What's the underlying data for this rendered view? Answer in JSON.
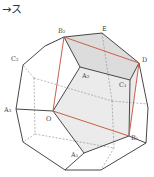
{
  "caption": "→ス",
  "colors": {
    "edge": "#333333",
    "hidden": "#888888",
    "red": "#c8604c",
    "shade": "#dcdcdc",
    "shade_light": "#ebebeb"
  },
  "points": {
    "B2": [
      64,
      37
    ],
    "E": [
      102,
      33
    ],
    "D": [
      139,
      63
    ],
    "C1": [
      130,
      80
    ],
    "A2": [
      80,
      67
    ],
    "O": [
      53,
      111
    ],
    "B1": [
      129,
      136
    ],
    "A1": [
      84,
      153
    ],
    "C2": [
      23,
      65
    ],
    "A3": [
      16,
      109
    ],
    "P_tl": [
      45,
      46
    ],
    "P_bl": [
      23,
      142
    ],
    "P_b1": [
      65,
      170
    ],
    "P_b2": [
      101,
      170
    ],
    "P_br": [
      146,
      143
    ],
    "P_r": [
      148,
      108
    ],
    "I_l1": [
      34,
      78
    ],
    "I_l2": [
      35,
      134
    ],
    "I_c": [
      112,
      101
    ],
    "I_b": [
      114,
      148
    ],
    "I_r": [
      148,
      104
    ]
  },
  "labels": [
    {
      "text": "B₂",
      "x": 58,
      "y": 33
    },
    {
      "text": "E",
      "x": 102,
      "y": 31
    },
    {
      "text": "D",
      "x": 142,
      "y": 62
    },
    {
      "text": "C₂",
      "x": 11,
      "y": 61
    },
    {
      "text": "A₂",
      "x": 82,
      "y": 78
    },
    {
      "text": "C₁",
      "x": 119,
      "y": 87
    },
    {
      "text": "A₃",
      "x": 4,
      "y": 112
    },
    {
      "text": "O",
      "x": 46,
      "y": 121
    },
    {
      "text": "B₁",
      "x": 131,
      "y": 140
    },
    {
      "text": "A₁",
      "x": 71,
      "y": 157
    }
  ]
}
